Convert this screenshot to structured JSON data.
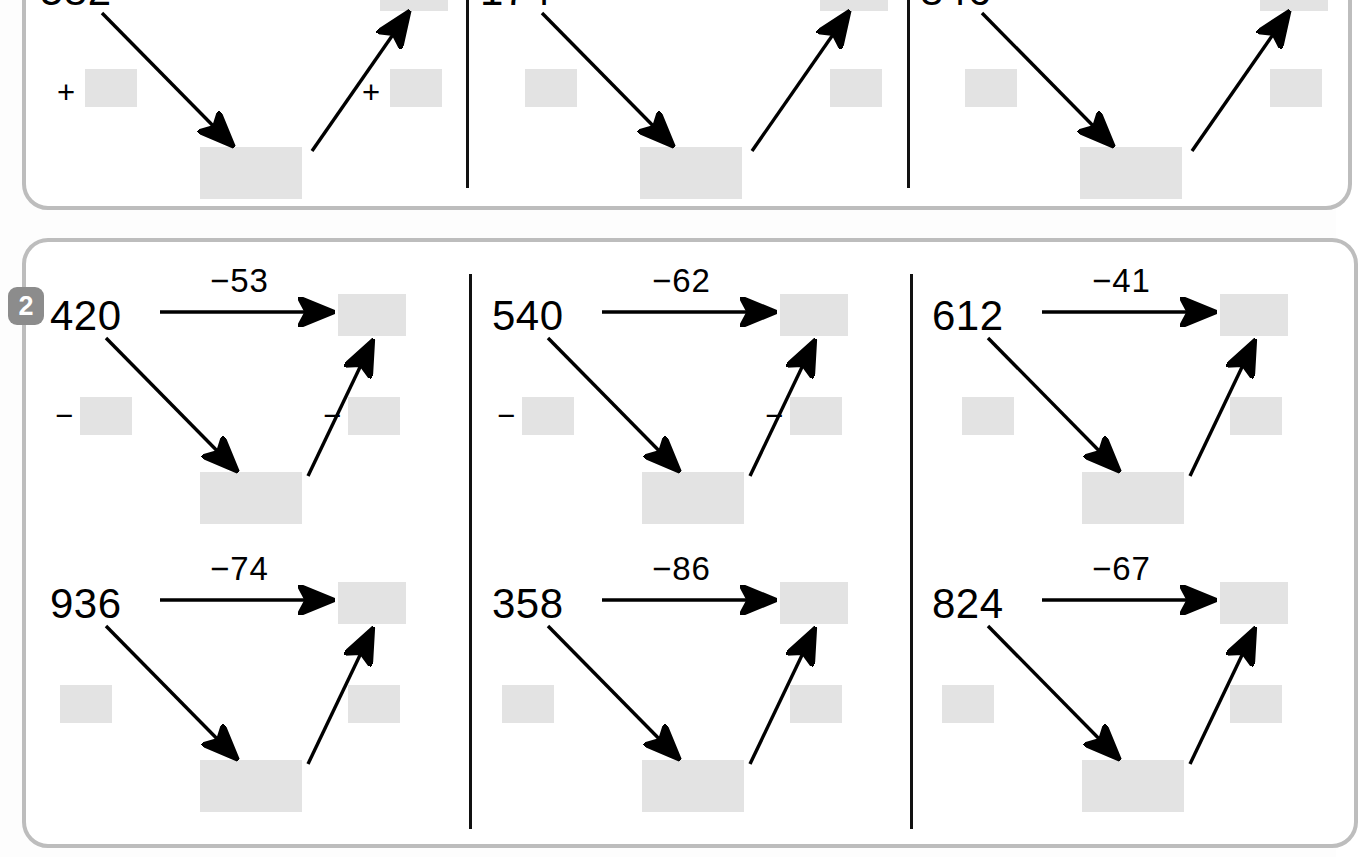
{
  "worksheet": {
    "background_color": "#fdfdfd",
    "card_border_color": "#bdbdbd",
    "blank_color": "#e3e3e3",
    "ink_color": "#000000",
    "badge_color": "#8c8c8c"
  },
  "exercises": [
    {
      "number": "",
      "badge_visible": false,
      "operator": "+",
      "side_signs_visible": [
        true,
        false,
        false
      ],
      "cells": [
        {
          "start": "582",
          "op_label": "",
          "sign_left": "+",
          "sign_right": "+"
        },
        {
          "start": "174",
          "op_label": "",
          "sign_left": "",
          "sign_right": ""
        },
        {
          "start": "846",
          "op_label": "",
          "sign_left": "",
          "sign_right": ""
        }
      ]
    },
    {
      "number": "2",
      "badge_visible": true,
      "operator": "-",
      "side_signs_visible": [
        true,
        true,
        false
      ],
      "rows": [
        [
          {
            "start": "420",
            "op_label": "−53",
            "sign_left": "−",
            "sign_right": "−"
          },
          {
            "start": "540",
            "op_label": "−62",
            "sign_left": "−",
            "sign_right": "−"
          },
          {
            "start": "612",
            "op_label": "−41",
            "sign_left": "",
            "sign_right": ""
          }
        ],
        [
          {
            "start": "936",
            "op_label": "−74",
            "sign_left": "",
            "sign_right": ""
          },
          {
            "start": "358",
            "op_label": "−86",
            "sign_left": "",
            "sign_right": ""
          },
          {
            "start": "824",
            "op_label": "−67",
            "sign_left": "",
            "sign_right": ""
          }
        ]
      ]
    }
  ]
}
